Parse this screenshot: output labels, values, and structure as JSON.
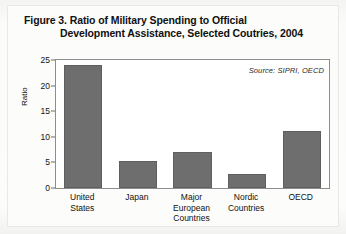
{
  "figure": {
    "title_line_1": "Figure 3. Ratio of Military Spending to Official",
    "title_line_2": "Development Assistance, Selected Coutries, 2004",
    "source_note": "Source: SIPRI, OECD",
    "bar_color": "#6e6e6e",
    "frame_color": "#8d8d8d"
  },
  "chart_data": {
    "type": "bar",
    "title": "Figure 3. Ratio of Military Spending to Official Development Assistance, Selected Coutries, 2004",
    "xlabel": "",
    "ylabel": "Ratio",
    "ylim": [
      0,
      25
    ],
    "yticks": [
      0,
      5,
      10,
      15,
      20,
      25
    ],
    "ytick_labels": [
      "0",
      "5",
      "10",
      "15",
      "20",
      "25"
    ],
    "grid": false,
    "legend": false,
    "annotations": [
      "Source: SIPRI, OECD"
    ],
    "categories": [
      "United States",
      "Japan",
      "Major European Countries",
      "Nordic Countries",
      "OECD"
    ],
    "category_lines": [
      [
        "United",
        "States"
      ],
      [
        "Japan"
      ],
      [
        "Major",
        "European",
        "Countries"
      ],
      [
        "Nordic",
        "Countries"
      ],
      [
        "OECD"
      ]
    ],
    "values": [
      24.0,
      5.2,
      7.0,
      2.7,
      11.2
    ]
  }
}
